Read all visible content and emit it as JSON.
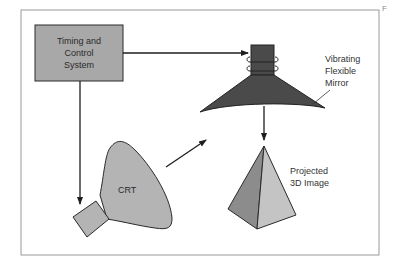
{
  "diagram": {
    "nodes": {
      "timing_control": {
        "label": "Timing and\nControl\nSystem",
        "fill": "#a8a8a8"
      },
      "crt": {
        "label": "CRT",
        "fill": "#b4b4b4"
      },
      "mirror": {
        "label": "Vibrating\nFlexible\nMirror",
        "fill": "#4a4a4a"
      },
      "image": {
        "label": "Projected\n3D Image",
        "fill_dark": "#8c8c8c",
        "fill_light": "#c4c4c4"
      }
    },
    "edges": [
      {
        "from": "timing_control",
        "to": "mirror"
      },
      {
        "from": "timing_control",
        "to": "crt"
      },
      {
        "from": "crt",
        "to": "mirror"
      },
      {
        "from": "mirror",
        "to": "image"
      }
    ],
    "edge_fragment": "F"
  },
  "colors": {
    "stroke": "#1e1e1e",
    "frame": "#9a9a9a",
    "background": "#ffffff"
  }
}
